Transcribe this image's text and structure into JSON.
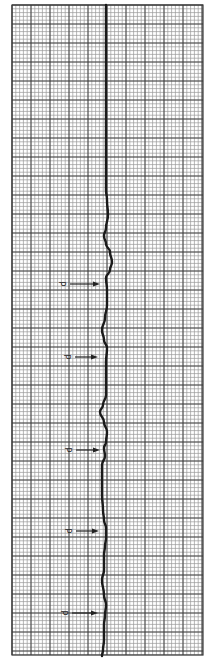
{
  "figure": {
    "marker_label": "P",
    "colors": {
      "paper": "#ffffff",
      "grid_minor": "#9a9a9a",
      "grid_major": "#3a3a3a",
      "trace": "#1a1a1a",
      "annotation": "#222222"
    }
  },
  "chart_data": {
    "type": "line",
    "title": "",
    "xlabel": "",
    "ylabel": "",
    "orientation": "vertical",
    "grid": true,
    "grid_bounds_px": {
      "x0": 12,
      "y0": 5,
      "x1": 203,
      "y1": 655
    },
    "grid_minor_px": 3.8,
    "grid_major_px": 19,
    "baseline_x_px": 106,
    "trace_points_px": [
      [
        106,
        5
      ],
      [
        106,
        190
      ],
      [
        107,
        200
      ],
      [
        108,
        215
      ],
      [
        106,
        228
      ],
      [
        104,
        236
      ],
      [
        106,
        244
      ],
      [
        110,
        252
      ],
      [
        112,
        262
      ],
      [
        110,
        270
      ],
      [
        106,
        278
      ],
      [
        107,
        290
      ],
      [
        107,
        305
      ],
      [
        105,
        318
      ],
      [
        102,
        330
      ],
      [
        104,
        340
      ],
      [
        107,
        348
      ],
      [
        106,
        362
      ],
      [
        106,
        380
      ],
      [
        106,
        395
      ],
      [
        103,
        405
      ],
      [
        100,
        412
      ],
      [
        104,
        422
      ],
      [
        107,
        432
      ],
      [
        106,
        442
      ],
      [
        104,
        448
      ],
      [
        105,
        456
      ],
      [
        102,
        465
      ],
      [
        102,
        480
      ],
      [
        102,
        495
      ],
      [
        103,
        510
      ],
      [
        104,
        520
      ],
      [
        106,
        528
      ],
      [
        106,
        538
      ],
      [
        105,
        546
      ],
      [
        104,
        555
      ],
      [
        104,
        570
      ],
      [
        102,
        580
      ],
      [
        104,
        595
      ],
      [
        106,
        605
      ],
      [
        105,
        615
      ],
      [
        104,
        625
      ],
      [
        104,
        640
      ],
      [
        103,
        650
      ],
      [
        102,
        656
      ]
    ],
    "annotations": [
      {
        "label": "P",
        "arrow_from_px": [
          70,
          284
        ],
        "arrow_to_px": [
          100,
          284
        ]
      },
      {
        "label": "P",
        "arrow_from_px": [
          75,
          357
        ],
        "arrow_to_px": [
          98,
          357
        ]
      },
      {
        "label": "P",
        "arrow_from_px": [
          76,
          450
        ],
        "arrow_to_px": [
          100,
          450
        ]
      },
      {
        "label": "P",
        "arrow_from_px": [
          76,
          531
        ],
        "arrow_to_px": [
          99,
          531
        ]
      },
      {
        "label": "P",
        "arrow_from_px": [
          72,
          613
        ],
        "arrow_to_px": [
          98,
          613
        ]
      }
    ]
  }
}
